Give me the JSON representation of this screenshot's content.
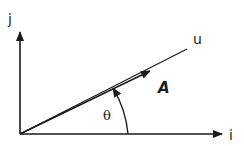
{
  "figure": {
    "labels": {
      "j_axis": "j",
      "i_axis": "i",
      "u_line": "u",
      "vector": "A",
      "angle": "θ"
    },
    "colors": {
      "stroke": "#1a1a1a",
      "background": "#ffffff"
    },
    "geometry": {
      "origin": [
        20,
        134
      ],
      "i_axis_end": [
        222,
        134
      ],
      "j_axis_end": [
        20,
        32
      ],
      "u_line_end": [
        187,
        49
      ],
      "vector_arrow_tip": [
        150,
        71
      ],
      "angle_arc_radius": 108
    }
  }
}
